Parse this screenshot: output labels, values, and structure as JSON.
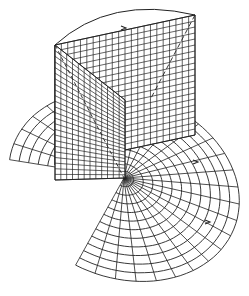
{
  "figure": {
    "caption": "",
    "stroke_color": "#222222",
    "background": "#ffffff",
    "polar_grid": {
      "center": [
        124,
        178
      ],
      "rings": 12,
      "spokes": 28,
      "outer_rx": 118,
      "outer_ry": 92,
      "tilt_deg": 20
    },
    "planes": [
      {
        "name": "back-plane",
        "corners": [
          [
            55,
            45
          ],
          [
            195,
            15
          ],
          [
            195,
            135
          ],
          [
            55,
            165
          ]
        ],
        "grid_cells": [
          22,
          20
        ]
      },
      {
        "name": "front-plane",
        "corners": [
          [
            55,
            45
          ],
          [
            125,
            100
          ],
          [
            125,
            178
          ],
          [
            55,
            180
          ]
        ],
        "grid_cells": [
          12,
          24
        ]
      }
    ],
    "arrows": [
      {
        "name": "arrow-top",
        "at": [
          124,
          28
        ]
      },
      {
        "name": "arrow-right-upper",
        "at": [
          196,
          162
        ]
      },
      {
        "name": "arrow-right-lower",
        "at": [
          208,
          222
        ]
      }
    ]
  }
}
